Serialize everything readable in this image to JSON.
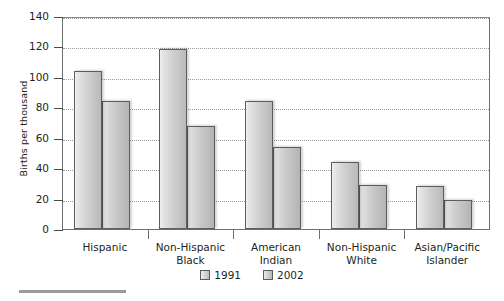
{
  "chart_data": {
    "type": "bar",
    "title": "",
    "xlabel": "",
    "ylabel": "Births per thousand",
    "ylim": [
      0,
      140
    ],
    "ytick_step": 20,
    "yticks": [
      0,
      20,
      40,
      60,
      80,
      100,
      120,
      140
    ],
    "ytick_labels": [
      "0",
      "20",
      "40",
      "60",
      "80",
      "100",
      "120",
      "140"
    ],
    "grid": true,
    "legend_position": "bottom-center",
    "categories": [
      "Hispanic",
      "Non-Hispanic Black",
      "American Indian",
      "Non-Hispanic White",
      "Asian/Pacific Islander"
    ],
    "category_label_lines": [
      [
        "Hispanic"
      ],
      [
        "Non-Hispanic",
        "Black"
      ],
      [
        "American",
        "Indian"
      ],
      [
        "Non-Hispanic",
        "White"
      ],
      [
        "Asian/Pacific",
        "Islander"
      ]
    ],
    "series": [
      {
        "name": "1991",
        "values": [
          104,
          118,
          84,
          44,
          28
        ],
        "color": "#d2d2d2"
      },
      {
        "name": "2002",
        "values": [
          84,
          68,
          54,
          29,
          19
        ],
        "color": "#c9c9c9"
      }
    ]
  },
  "legend": {
    "entries": [
      {
        "label": "1991"
      },
      {
        "label": "2002"
      }
    ]
  },
  "axis": {
    "y_title": "Births per thousand"
  }
}
